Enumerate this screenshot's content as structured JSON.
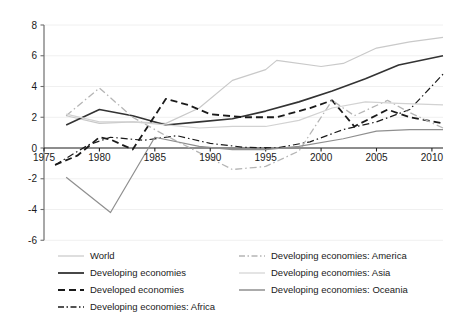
{
  "chart_data": {
    "type": "line",
    "title": "",
    "subtitle": "",
    "xlabel": "",
    "ylabel": "",
    "xlim": [
      1975,
      2011
    ],
    "ylim": [
      -6,
      8
    ],
    "xticks": [
      1975,
      1980,
      1985,
      1990,
      1995,
      2000,
      2005,
      2010
    ],
    "yticks": [
      -6,
      -4,
      -2,
      0,
      2,
      4,
      6,
      8
    ],
    "xtick_labels": [
      "1975",
      "1980",
      "1985",
      "1990",
      "1995",
      "2000",
      "2005",
      "2010"
    ],
    "ytick_labels": [
      "-6",
      "-4",
      "-2",
      "0",
      "2",
      "4",
      "6",
      "8"
    ],
    "grid": true,
    "grid_axis": "y",
    "legend_position": "bottom",
    "legend_columns": 2,
    "series": [
      {
        "name": "World",
        "style": "solid",
        "color": "#c9c9c9",
        "width": 1.2,
        "x": [
          1977,
          1980,
          1983,
          1986,
          1989,
          1992,
          1995,
          1996,
          2000,
          2002,
          2005,
          2008,
          2011
        ],
        "values": [
          2.1,
          1.6,
          1.7,
          1.6,
          2.6,
          4.4,
          5.1,
          5.7,
          5.3,
          5.5,
          6.5,
          6.9,
          7.2
        ]
      },
      {
        "name": "Developing economies",
        "style": "solid",
        "color": "#333333",
        "width": 1.6,
        "x": [
          1977,
          1980,
          1983,
          1986,
          1989,
          1992,
          1995,
          1998,
          2001,
          2004,
          2007,
          2011
        ],
        "values": [
          1.5,
          2.5,
          2.1,
          1.5,
          1.7,
          1.9,
          2.4,
          3.0,
          3.7,
          4.5,
          5.4,
          6.0
        ]
      },
      {
        "name": "Developed economies",
        "style": "dashed",
        "color": "#1a1a1a",
        "width": 1.8,
        "x": [
          1976,
          1978,
          1980,
          1981,
          1983,
          1986,
          1988,
          1990,
          1993,
          1996,
          1999,
          2001,
          2003,
          2006,
          2008,
          2011
        ],
        "values": [
          -1.1,
          -0.5,
          0.7,
          0.55,
          -0.1,
          3.2,
          2.8,
          2.2,
          2.0,
          2.0,
          2.6,
          3.1,
          1.4,
          2.5,
          2.0,
          1.6
        ]
      },
      {
        "name": "Developing economies: Africa",
        "style": "dashdot",
        "color": "#1a1a1a",
        "width": 1.2,
        "x": [
          1976,
          1979,
          1981,
          1984,
          1987,
          1990,
          1993,
          1996,
          1999,
          2002,
          2005,
          2008,
          2011
        ],
        "values": [
          -1.1,
          0.2,
          0.7,
          0.5,
          0.8,
          0.3,
          0.05,
          0.0,
          0.4,
          1.2,
          1.7,
          2.5,
          4.8
        ]
      },
      {
        "name": "Developing economies: America",
        "style": "dashdot",
        "color": "#b5b5b5",
        "width": 1.3,
        "x": [
          1977,
          1980,
          1983,
          1986,
          1989,
          1992,
          1995,
          1998,
          2001,
          2003,
          2006,
          2008,
          2011
        ],
        "values": [
          2.1,
          3.9,
          2.0,
          0.8,
          -0.3,
          -1.4,
          -1.2,
          -0.2,
          3.1,
          2.1,
          3.1,
          2.3,
          1.3
        ]
      },
      {
        "name": "Developing economies: Asia",
        "style": "solid",
        "color": "#d2d2d2",
        "width": 1.2,
        "x": [
          1977,
          1980,
          1983,
          1986,
          1989,
          1992,
          1995,
          1998,
          2001,
          2004,
          2007,
          2011
        ],
        "values": [
          2.2,
          1.7,
          1.7,
          1.5,
          1.3,
          1.4,
          1.4,
          1.8,
          2.6,
          3.0,
          2.9,
          2.8
        ]
      },
      {
        "name": "Developing economies: Oceania",
        "style": "solid",
        "color": "#8f8f8f",
        "width": 1.2,
        "x": [
          1977,
          1981,
          1985,
          1989,
          1992,
          1995,
          1998,
          2002,
          2005,
          2008,
          2011
        ],
        "values": [
          -1.9,
          -4.2,
          0.7,
          0.1,
          -0.1,
          -0.1,
          0.1,
          0.6,
          1.1,
          1.2,
          1.2
        ]
      }
    ]
  },
  "legend": {
    "left_column": [
      {
        "label": "World",
        "swatch": "solid-light"
      },
      {
        "label": "Developing economies",
        "swatch": "solid-dark"
      },
      {
        "label": "Developed economies",
        "swatch": "dashed-dark"
      },
      {
        "label": "Developing economies: Africa",
        "swatch": "dashdot-dark"
      }
    ],
    "right_column": [
      {
        "label": "Developing economies: America",
        "swatch": "dashdot-light"
      },
      {
        "label": "Developing economies: Asia",
        "swatch": "solid-lighter"
      },
      {
        "label": "Developing economies: Oceania",
        "swatch": "solid-gray"
      }
    ]
  },
  "axes": {
    "y_tick_labels": [
      "8",
      "6",
      "4",
      "2",
      "0",
      "-2",
      "-4",
      "-6"
    ],
    "x_tick_labels": [
      "1975",
      "1980",
      "1985",
      "1990",
      "1995",
      "2000",
      "2005",
      "2010"
    ]
  },
  "colors": {
    "world": "#c9c9c9",
    "developing": "#333333",
    "developed": "#1a1a1a",
    "africa": "#1a1a1a",
    "america": "#b5b5b5",
    "asia": "#d2d2d2",
    "oceania": "#8f8f8f",
    "axis": "#6e6e6e",
    "grid": "#f0f0f0",
    "text": "#1a1a1a"
  }
}
